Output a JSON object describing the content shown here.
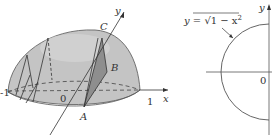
{
  "figure_left": {
    "title": "Solid with semicircular (hemispherical-dome) base",
    "points": {
      "A": "A",
      "B": "B",
      "C": "C"
    },
    "axis_labels": {
      "x": "x",
      "y": "y"
    },
    "ticks": {
      "left": "-1",
      "origin": "0",
      "right": "1"
    },
    "colors": {
      "surface": "#bdbdbd",
      "shade": "#8e8e8e",
      "line": "#333333"
    }
  },
  "figure_right": {
    "equation": "y = √(1 − x²)",
    "equation_lhs": "y = ",
    "equation_sqrt": "√",
    "equation_radicand": "1 − x",
    "equation_exp": "2",
    "axis_labels": {
      "y": "y"
    },
    "ticks": {
      "origin": "0"
    }
  }
}
